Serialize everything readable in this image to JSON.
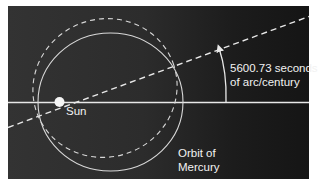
{
  "diagram": {
    "type": "orbital-precession",
    "colors": {
      "background_left": "#333333",
      "background_right": "#151515",
      "lines": "#e8e8e8",
      "sun": "#f5f5f5",
      "text": "#f2f2f2"
    },
    "labels": {
      "angle_line1": "5600.73 seconds",
      "angle_line2": "of arc/century",
      "sun": "Sun",
      "orbit_line1": "Orbit of",
      "orbit_line2": "Mercury"
    },
    "elements": {
      "reference_axis": "horizontal solid line",
      "precessed_axis": "dashed line rotated counter-clockwise",
      "orbit_current": "solid ellipse",
      "orbit_precessed": "dashed rotated ellipse",
      "angle_arrow": "curved arrow from solid axis to dashed axis"
    }
  }
}
